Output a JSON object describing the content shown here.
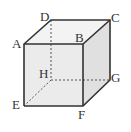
{
  "diagram": {
    "type": "cube",
    "vertices": {
      "A": {
        "label": "A"
      },
      "B": {
        "label": "B"
      },
      "C": {
        "label": "C"
      },
      "D": {
        "label": "D"
      },
      "E": {
        "label": "E"
      },
      "F": {
        "label": "F"
      },
      "G": {
        "label": "G"
      },
      "H": {
        "label": "H"
      }
    },
    "hidden_edges": [
      "DH",
      "HE",
      "HG"
    ],
    "colors": {
      "edge": "#333333",
      "face": "#e8e8e8",
      "top": "#f2f2f2",
      "side": "#dcdcdc"
    }
  }
}
